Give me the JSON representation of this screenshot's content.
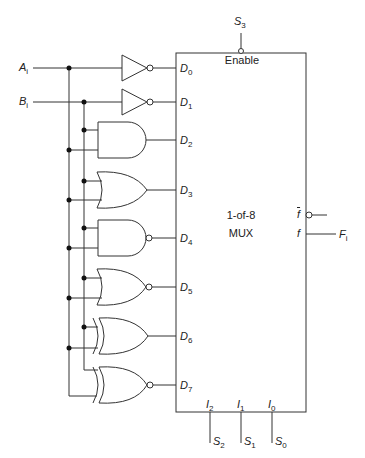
{
  "diagram": {
    "inputs": [
      {
        "name": "A",
        "sub": "i"
      },
      {
        "name": "B",
        "sub": "i"
      }
    ],
    "mux": {
      "line1": "1-of-8",
      "line2": "MUX",
      "enable_label": "Enable",
      "enable_signal": {
        "name": "S",
        "sub": "3"
      },
      "data_inputs": [
        {
          "name": "D",
          "sub": "0",
          "gate": "NOT A"
        },
        {
          "name": "D",
          "sub": "1",
          "gate": "NOT B"
        },
        {
          "name": "D",
          "sub": "2",
          "gate": "AND"
        },
        {
          "name": "D",
          "sub": "3",
          "gate": "OR"
        },
        {
          "name": "D",
          "sub": "4",
          "gate": "NAND"
        },
        {
          "name": "D",
          "sub": "5",
          "gate": "NOR"
        },
        {
          "name": "D",
          "sub": "6",
          "gate": "XOR"
        },
        {
          "name": "D",
          "sub": "7",
          "gate": "XNOR"
        }
      ],
      "select_inputs": [
        {
          "name": "I",
          "sub": "2",
          "signal": "S",
          "signal_sub": "2"
        },
        {
          "name": "I",
          "sub": "1",
          "signal": "S",
          "signal_sub": "1"
        },
        {
          "name": "I",
          "sub": "0",
          "signal": "S",
          "signal_sub": "0"
        }
      ],
      "outputs": [
        {
          "name": "f",
          "inverted": true
        },
        {
          "name": "f",
          "inverted": false,
          "signal": "F",
          "signal_sub": "i"
        }
      ]
    }
  }
}
